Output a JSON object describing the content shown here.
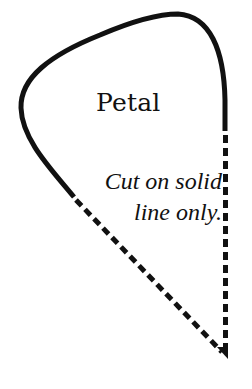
{
  "diagram": {
    "title": "Petal",
    "instructions": {
      "line1": "Cut on solid",
      "line2": "line only."
    },
    "colors": {
      "stroke": "#111111",
      "background": "#ffffff"
    },
    "legend": {
      "solid_line": "cut line",
      "dashed_line": "fold/do not cut line"
    }
  }
}
